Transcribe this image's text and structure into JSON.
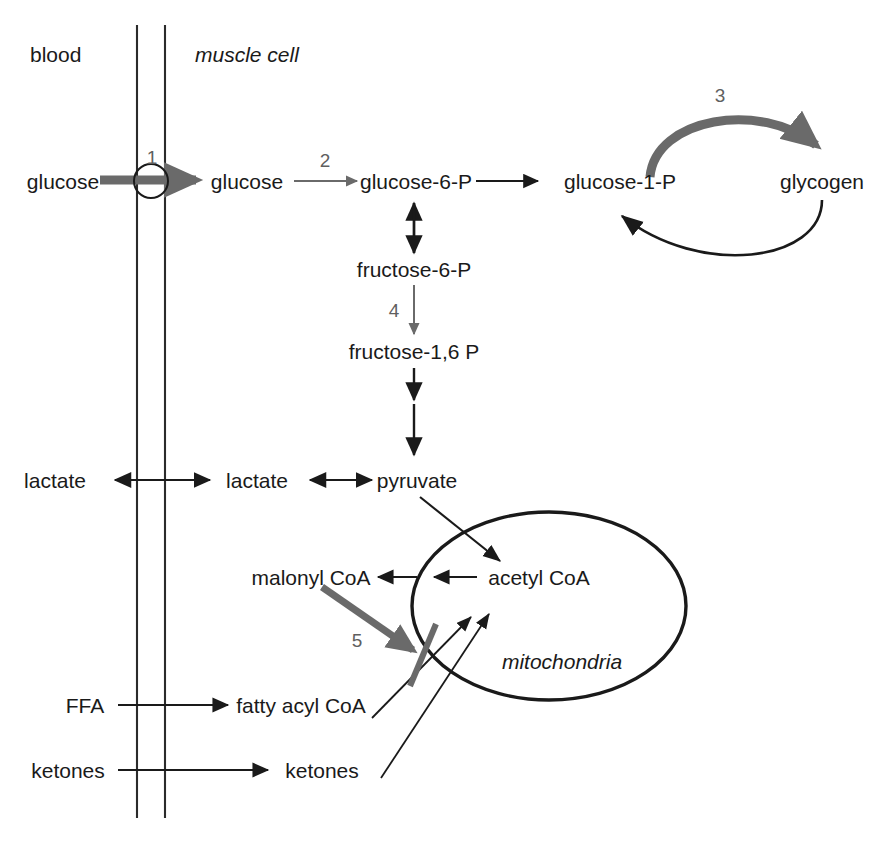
{
  "figure": {
    "compartments": {
      "blood_label": "blood",
      "cell_label": "muscle cell",
      "organelle_label": "mitochondria"
    },
    "metabolites": {
      "glucose_blood": "glucose",
      "glucose_cell": "glucose",
      "glucose_6_p": "glucose-6-P",
      "glucose_1_p": "glucose-1-P",
      "glycogen": "glycogen",
      "fructose_6_p": "fructose-6-P",
      "fructose_1_6_p": "fructose-1,6 P",
      "pyruvate": "pyruvate",
      "lactate_blood": "lactate",
      "lactate_cell": "lactate",
      "acetyl_coa": "acetyl CoA",
      "malonyl_coa": "malonyl  CoA",
      "ffa_blood": "FFA",
      "fatty_acyl_coa": "fatty acyl CoA",
      "ketones_blood": "ketones",
      "ketones_cell": "ketones"
    },
    "step_numbers": {
      "step1": "1",
      "step2": "2",
      "step3": "3",
      "step4": "4",
      "step5": "5"
    },
    "colors": {
      "ink": "#1a1a1a",
      "gray_arrow": "#6a6a6a",
      "number_gray": "#5f5f5f",
      "membrane": "#2b2b2b",
      "background": "#ffffff"
    }
  }
}
